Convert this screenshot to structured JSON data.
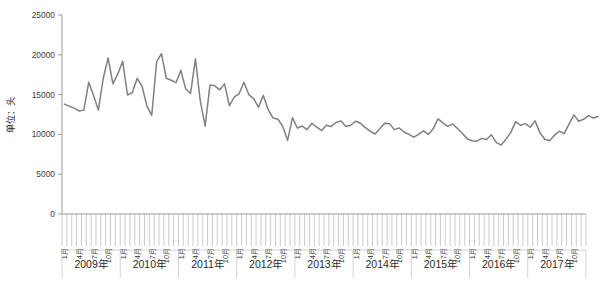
{
  "chart_data": {
    "type": "line",
    "title": "",
    "xlabel": "",
    "ylabel": "单位：头",
    "ylim": [
      0,
      25000
    ],
    "ytick_values": [
      0,
      5000,
      10000,
      15000,
      20000,
      25000
    ],
    "ytick_labels": [
      "0",
      "5000",
      "10000",
      "15000",
      "20000",
      "25000"
    ],
    "grid": false,
    "legend": "none",
    "line_color": "#808080",
    "axis_color": "#9a9a9a",
    "month_tick_labels": [
      "1月",
      "4月",
      "7月",
      "10月"
    ],
    "month_tick_label_months": [
      1,
      4,
      7,
      10
    ],
    "year_groups": [
      "2009年",
      "2010年",
      "2011年",
      "2012年",
      "2013年",
      "2014年",
      "2015年",
      "2016年",
      "2017年"
    ],
    "x_start": "2009-01",
    "x_end": "2017-12",
    "x_count": 108,
    "series": [
      {
        "name": "数量",
        "values": [
          13800,
          13550,
          13300,
          12950,
          13050,
          16550,
          14900,
          13050,
          17050,
          19600,
          16350,
          17600,
          19200,
          14950,
          15250,
          17050,
          16050,
          13550,
          12400,
          19100,
          20150,
          17050,
          16800,
          16500,
          18050,
          15700,
          15150,
          19500,
          14200,
          11050,
          16200,
          16100,
          15600,
          16350,
          13600,
          14700,
          15100,
          16550,
          15000,
          14500,
          13400,
          14900,
          13100,
          12050,
          11900,
          11000,
          9250,
          12100,
          10800,
          11050,
          10600,
          11400,
          10900,
          10500,
          11150,
          11000,
          11500,
          11700,
          11000,
          11150,
          11650,
          11400,
          10850,
          10400,
          10050,
          10700,
          11400,
          11350,
          10600,
          10800,
          10300,
          10000,
          9650,
          10000,
          10450,
          10000,
          10700,
          11950,
          11450,
          11000,
          11300,
          10750,
          10150,
          9450,
          9200,
          9150,
          9500,
          9350,
          9950,
          9000,
          8650,
          9400,
          10250,
          11600,
          11150,
          11350,
          10900,
          11700,
          10200,
          9400,
          9200,
          9900,
          10400,
          10100,
          11300,
          12450,
          11650,
          11900,
          12350,
          12050,
          12250
        ]
      }
    ]
  },
  "layout": {
    "plot_left": 62,
    "plot_right": 586,
    "plot_top": 15,
    "plot_bottom": 214,
    "month_band_bottom": 250,
    "year_band_bottom": 278
  }
}
